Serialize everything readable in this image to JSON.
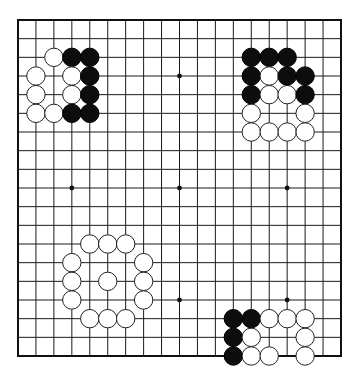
{
  "diagram": {
    "title": "Go board diagram",
    "board_size": 19,
    "colors": {
      "line": "#1a1a1a",
      "black_stone": "#0d0d0d",
      "white_stone": "#ffffff",
      "background": "#ffffff"
    },
    "hoshi": [
      [
        9,
        3
      ],
      [
        3,
        9
      ],
      [
        9,
        9
      ],
      [
        15,
        9
      ],
      [
        9,
        15
      ],
      [
        15,
        15
      ],
      [
        3,
        3
      ],
      [
        15,
        3
      ],
      [
        3,
        15
      ]
    ],
    "groups": [
      {
        "name": "top-left",
        "stones": [
          {
            "col": 2,
            "row": 2,
            "color": "white"
          },
          {
            "col": 3,
            "row": 2,
            "color": "black"
          },
          {
            "col": 4,
            "row": 2,
            "color": "black"
          },
          {
            "col": 1,
            "row": 3,
            "color": "white"
          },
          {
            "col": 3,
            "row": 3,
            "color": "white"
          },
          {
            "col": 4,
            "row": 3,
            "color": "black"
          },
          {
            "col": 1,
            "row": 4,
            "color": "white"
          },
          {
            "col": 3,
            "row": 4,
            "color": "white"
          },
          {
            "col": 4,
            "row": 4,
            "color": "black"
          },
          {
            "col": 1,
            "row": 5,
            "color": "white"
          },
          {
            "col": 2,
            "row": 5,
            "color": "white"
          },
          {
            "col": 3,
            "row": 5,
            "color": "black"
          },
          {
            "col": 4,
            "row": 5,
            "color": "black"
          }
        ]
      },
      {
        "name": "top-right",
        "stones": [
          {
            "col": 13,
            "row": 2,
            "color": "black"
          },
          {
            "col": 14,
            "row": 2,
            "color": "black"
          },
          {
            "col": 15,
            "row": 2,
            "color": "black"
          },
          {
            "col": 13,
            "row": 3,
            "color": "black"
          },
          {
            "col": 14,
            "row": 3,
            "color": "white"
          },
          {
            "col": 15,
            "row": 3,
            "color": "black"
          },
          {
            "col": 16,
            "row": 3,
            "color": "black"
          },
          {
            "col": 13,
            "row": 4,
            "color": "black"
          },
          {
            "col": 14,
            "row": 4,
            "color": "white"
          },
          {
            "col": 15,
            "row": 4,
            "color": "white"
          },
          {
            "col": 16,
            "row": 4,
            "color": "black"
          },
          {
            "col": 13,
            "row": 5,
            "color": "white"
          },
          {
            "col": 16,
            "row": 5,
            "color": "white"
          },
          {
            "col": 13,
            "row": 6,
            "color": "white"
          },
          {
            "col": 14,
            "row": 6,
            "color": "white"
          },
          {
            "col": 15,
            "row": 6,
            "color": "white"
          },
          {
            "col": 16,
            "row": 6,
            "color": "white"
          }
        ]
      },
      {
        "name": "bottom-left",
        "stones": [
          {
            "col": 4,
            "row": 12,
            "color": "white"
          },
          {
            "col": 5,
            "row": 12,
            "color": "white"
          },
          {
            "col": 6,
            "row": 12,
            "color": "white"
          },
          {
            "col": 3,
            "row": 13,
            "color": "white"
          },
          {
            "col": 7,
            "row": 13,
            "color": "white"
          },
          {
            "col": 3,
            "row": 14,
            "color": "white"
          },
          {
            "col": 5,
            "row": 14,
            "color": "white"
          },
          {
            "col": 7,
            "row": 14,
            "color": "white"
          },
          {
            "col": 3,
            "row": 15,
            "color": "white"
          },
          {
            "col": 7,
            "row": 15,
            "color": "white"
          },
          {
            "col": 4,
            "row": 16,
            "color": "white"
          },
          {
            "col": 5,
            "row": 16,
            "color": "white"
          },
          {
            "col": 6,
            "row": 16,
            "color": "white"
          }
        ]
      },
      {
        "name": "bottom-right",
        "stones": [
          {
            "col": 12,
            "row": 16,
            "color": "black"
          },
          {
            "col": 13,
            "row": 16,
            "color": "black"
          },
          {
            "col": 14,
            "row": 16,
            "color": "white"
          },
          {
            "col": 15,
            "row": 16,
            "color": "white"
          },
          {
            "col": 16,
            "row": 16,
            "color": "white"
          },
          {
            "col": 12,
            "row": 17,
            "color": "black"
          },
          {
            "col": 13,
            "row": 17,
            "color": "white"
          },
          {
            "col": 16,
            "row": 17,
            "color": "white"
          },
          {
            "col": 12,
            "row": 18,
            "color": "black"
          },
          {
            "col": 13,
            "row": 18,
            "color": "white"
          },
          {
            "col": 14,
            "row": 18,
            "color": "white"
          },
          {
            "col": 16,
            "row": 18,
            "color": "white"
          }
        ]
      }
    ]
  }
}
